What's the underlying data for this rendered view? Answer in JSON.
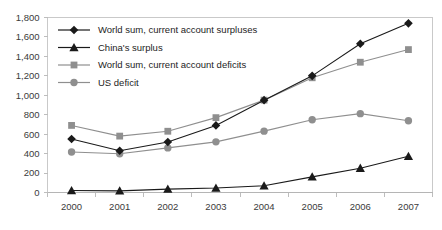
{
  "chart_data": {
    "type": "line",
    "title": "",
    "xlabel": "",
    "ylabel": "",
    "x": [
      "2000",
      "2001",
      "2002",
      "2003",
      "2004",
      "2005",
      "2006",
      "2007"
    ],
    "ylim": [
      0,
      1800
    ],
    "ytick_labels": [
      "0",
      "200",
      "400",
      "600",
      "800",
      "1,000",
      "1,200",
      "1,400",
      "1,600",
      "1,800"
    ],
    "ytick_values": [
      0,
      200,
      400,
      600,
      800,
      1000,
      1200,
      1400,
      1600,
      1800
    ],
    "grid": false,
    "legend_position": "top-left-inside",
    "series": [
      {
        "name": "World sum, current account surpluses",
        "marker": "diamond",
        "color": "#1a1a1a",
        "values": [
          550,
          430,
          520,
          690,
          950,
          1200,
          1530,
          1740
        ]
      },
      {
        "name": "China's surplus",
        "marker": "triangle",
        "color": "#1a1a1a",
        "values": [
          20,
          17,
          35,
          46,
          69,
          161,
          250,
          372
        ]
      },
      {
        "name": "World sum, current account deficits",
        "marker": "square",
        "color": "#8f8f8f",
        "values": [
          690,
          580,
          630,
          770,
          950,
          1180,
          1340,
          1470
        ]
      },
      {
        "name": "US deficit",
        "marker": "circle",
        "color": "#8f8f8f",
        "values": [
          417,
          398,
          459,
          521,
          631,
          749,
          811,
          738
        ]
      }
    ]
  },
  "legend": {
    "items": [
      {
        "label": "World sum, current account surpluses"
      },
      {
        "label": "China's surplus"
      },
      {
        "label": "World sum, current account deficits"
      },
      {
        "label": "US deficit"
      }
    ]
  },
  "axes": {
    "y_labels": [
      "1,800",
      "1,600",
      "1,400",
      "1,200",
      "1,000",
      "800",
      "600",
      "400",
      "200",
      "0"
    ],
    "x_labels": [
      "2000",
      "2001",
      "2002",
      "2003",
      "2004",
      "2005",
      "2006",
      "2007"
    ]
  },
  "colors": {
    "dark_series": "#1a1a1a",
    "light_series": "#8f8f8f",
    "axis": "#b5b5b5",
    "border": "#c9c9c9",
    "text": "#3b3b3b",
    "background": "#ffffff"
  }
}
